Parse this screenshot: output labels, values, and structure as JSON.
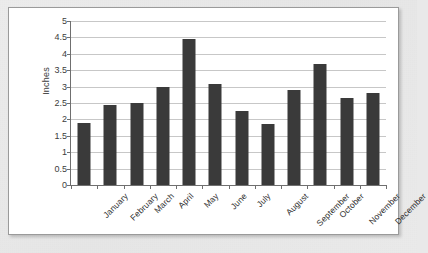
{
  "chart_data": {
    "type": "bar",
    "title": "",
    "xlabel": "",
    "ylabel": "Inches",
    "ylim": [
      0,
      5
    ],
    "ytick_step": 0.5,
    "grid": true,
    "legend": false,
    "bar_color": "#3a3a3a",
    "gridline_color": "#c7c7c7",
    "axis_color": "#6f6f6f",
    "panel_background": "#ffffff",
    "page_background": "#e9e9e9",
    "categories": [
      "January",
      "February",
      "March",
      "April",
      "May",
      "June",
      "July",
      "August",
      "September",
      "October",
      "November",
      "December"
    ],
    "values": [
      1.9,
      2.45,
      2.5,
      3.0,
      4.45,
      3.08,
      2.25,
      1.87,
      2.9,
      3.7,
      2.65,
      2.8
    ],
    "ytick_labels": [
      "0",
      "0.5",
      "1",
      "1.5",
      "2",
      "2.5",
      "3",
      "3.5",
      "4",
      "4.5",
      "5"
    ]
  },
  "caption": {
    "text": ""
  }
}
